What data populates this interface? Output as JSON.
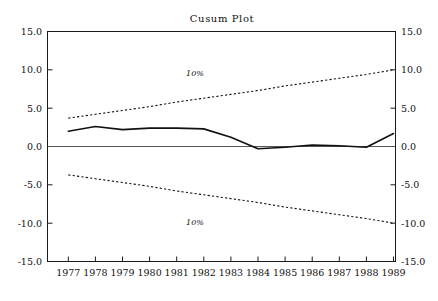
{
  "chart_data": {
    "type": "line",
    "title": "Cusum Plot",
    "xlabel": "",
    "ylabel": "",
    "xlim": [
      1976.6,
      1989.4
    ],
    "ylim": [
      -15.0,
      15.0
    ],
    "grid": false,
    "legend": "none",
    "x": [
      1977,
      1978,
      1979,
      1980,
      1981,
      1982,
      1983,
      1984,
      1985,
      1986,
      1987,
      1988,
      1989
    ],
    "y_ticks": [
      15.0,
      10.0,
      5.0,
      0.0,
      -5.0,
      -10.0,
      -15.0
    ],
    "y_tick_labels": [
      "15.0",
      "10.0",
      "5.0",
      "0.0",
      "-5.0",
      "-10.0",
      "-15.0"
    ],
    "x_ticks": [
      1977,
      1978,
      1979,
      1980,
      1981,
      1982,
      1983,
      1984,
      1985,
      1986,
      1987,
      1988,
      1989
    ],
    "x_tick_labels": [
      "1977",
      "1978",
      "1979",
      "1980",
      "1981",
      "1982",
      "1983",
      "1984",
      "1985",
      "1986",
      "1987",
      "1988",
      "1989"
    ],
    "series": [
      {
        "name": "cusum",
        "style": "solid",
        "values": [
          2.0,
          2.6,
          2.2,
          2.4,
          2.4,
          2.3,
          1.2,
          -0.3,
          -0.1,
          0.2,
          0.1,
          -0.1,
          1.7
        ]
      },
      {
        "name": "upper-10-percent-boundary",
        "style": "dashed",
        "label": "10%",
        "values": [
          3.7,
          4.2,
          4.7,
          5.2,
          5.8,
          6.3,
          6.8,
          7.3,
          7.9,
          8.4,
          8.9,
          9.4,
          10.0
        ]
      },
      {
        "name": "lower-10-percent-boundary",
        "style": "dashed",
        "label": "10%",
        "values": [
          -3.7,
          -4.2,
          -4.7,
          -5.2,
          -5.8,
          -6.3,
          -6.8,
          -7.3,
          -7.9,
          -8.4,
          -8.9,
          -9.4,
          -10.0
        ]
      }
    ],
    "annotations": [
      {
        "name": "upper-boundary-label",
        "text": "10%",
        "x": 1981.0,
        "y": 7.4
      },
      {
        "name": "lower-boundary-label",
        "text": "10%",
        "x": 1981.0,
        "y": -8.6
      }
    ],
    "zero_reference_line": 0.0,
    "colors": {
      "series": "#111111",
      "boundary": "#111111",
      "axis": "#1a1a1a",
      "zero_line": "#555555",
      "background": "#ffffff"
    }
  },
  "axes": {
    "left_labels": [
      "15.0",
      "10.0",
      "5.0",
      "0.0",
      "-5.0",
      "-10.0",
      "-15.0"
    ],
    "right_labels": [
      "15.0",
      "10.0",
      "5.0",
      "0.0",
      "-5.0",
      "-10.0",
      "-15.0"
    ]
  }
}
